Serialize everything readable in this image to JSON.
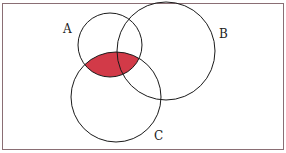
{
  "diagram": {
    "type": "venn",
    "sets": [
      {
        "label": "A",
        "cx": 110,
        "cy": 45,
        "r": 32,
        "label_x": 63,
        "label_y": 33
      },
      {
        "label": "B",
        "cx": 166,
        "cy": 51,
        "r": 49,
        "label_x": 219,
        "label_y": 38
      },
      {
        "label": "C",
        "cx": 116,
        "cy": 97,
        "r": 45,
        "label_x": 154,
        "label_y": 140
      }
    ],
    "shaded_region": "A ∩ C",
    "colors": {
      "shade": "#d23a48",
      "stroke": "#1a1a1a",
      "border": "#8a6e74",
      "background": "#ffffff"
    }
  }
}
